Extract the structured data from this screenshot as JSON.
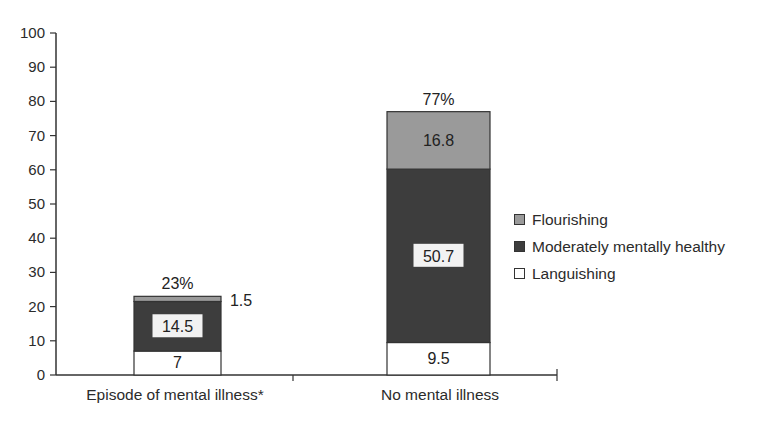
{
  "chart_data": {
    "type": "bar",
    "stacked": true,
    "title": "",
    "xlabel": "",
    "ylabel": "",
    "ylim": [
      0,
      100
    ],
    "yticks": [
      0,
      10,
      20,
      30,
      40,
      50,
      60,
      70,
      80,
      90,
      100
    ],
    "categories": [
      "Episode of mental illness*",
      "No mental illness"
    ],
    "series": [
      {
        "name": "Languishing",
        "color": "#ffffff",
        "values": [
          7,
          9.5
        ]
      },
      {
        "name": "Moderately mentally healthy",
        "color": "#3d3d3d",
        "values": [
          14.5,
          50.7
        ]
      },
      {
        "name": "Flourishing",
        "color": "#9a9a9a",
        "values": [
          1.5,
          16.8
        ]
      }
    ],
    "totals": [
      "23%",
      "77%"
    ],
    "segment_labels": [
      {
        "languishing": "7",
        "moderately": "14.5",
        "flourishing": "1.5"
      },
      {
        "languishing": "9.5",
        "moderately": "50.7",
        "flourishing": "16.8"
      }
    ],
    "legend": {
      "position": "right",
      "entries": [
        "Flourishing",
        "Moderately mentally healthy",
        "Languishing"
      ]
    },
    "grid": false
  }
}
